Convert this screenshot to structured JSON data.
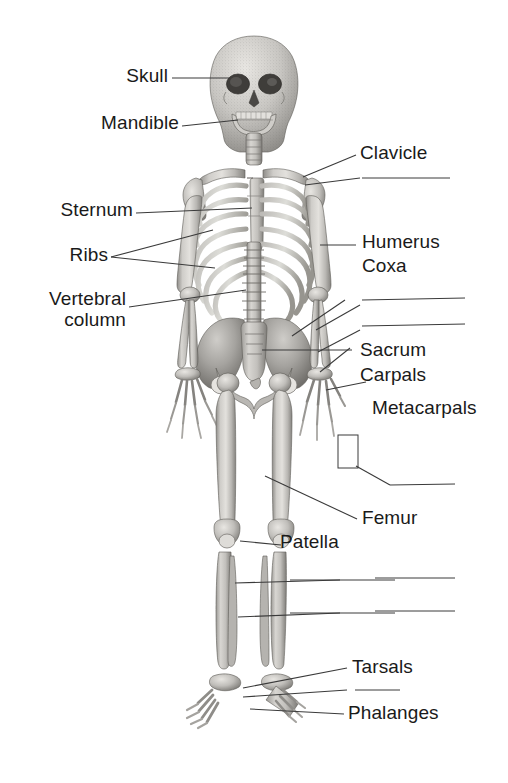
{
  "figure": {
    "width": 508,
    "height": 783,
    "background_color": "#ffffff",
    "line_color": "#3a3a3a",
    "text_color": "#1a1a1a",
    "bone_light": "#d8d6d2",
    "bone_mid": "#a9a7a3",
    "bone_dark": "#6f6d6a"
  },
  "labels": {
    "skull": "Skull",
    "mandible": "Mandible",
    "clavicle": "Clavicle",
    "sternum": "Sternum",
    "ribs": "Ribs",
    "vertebral_line1": "Vertebral",
    "vertebral_line2": "column",
    "humerus": "Humerus",
    "coxa": "Coxa",
    "sacrum": "Sacrum",
    "carpals": "Carpals",
    "metacarpals": "Metacarpals",
    "femur": "Femur",
    "patella": "Patella",
    "tarsals": "Tarsals",
    "phalanges": "Phalanges"
  },
  "blank_answer_lines": {
    "count": 8,
    "note": "Unlabeled fill-in-the-blank leader lines"
  },
  "leader_lines": {
    "count": 16
  }
}
